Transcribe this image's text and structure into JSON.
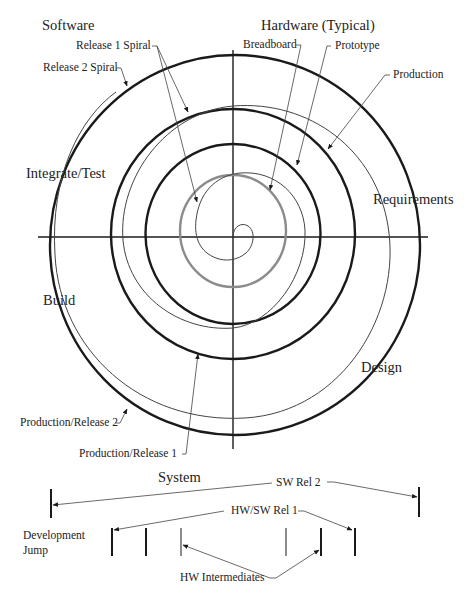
{
  "quadrant_titles": {
    "software": "Software",
    "hardware": "Hardware (Typical)"
  },
  "phases": {
    "integrate_test": "Integrate/Test",
    "requirements": "Requirements",
    "build": "Build",
    "design": "Design"
  },
  "callouts": {
    "release1_spiral": "Release 1 Spiral",
    "release2_spiral": "Release 2 Spiral",
    "breadboard": "Breadboard",
    "prototype": "Prototype",
    "production": "Production",
    "production_release2": "Production/Release 2",
    "production_release1": "Production/Release 1"
  },
  "timeline": {
    "title": "System",
    "sw_rel2": "SW Rel 2",
    "hw_sw_rel1": "HW/SW Rel 1",
    "development_jump_line1": "Development",
    "development_jump_line2": "Jump",
    "hw_intermediates": "HW Intermediates"
  },
  "colors": {
    "ink": "#1a1a1a",
    "gray_ring": "#8c8c8c",
    "thin_line": "#444444"
  }
}
